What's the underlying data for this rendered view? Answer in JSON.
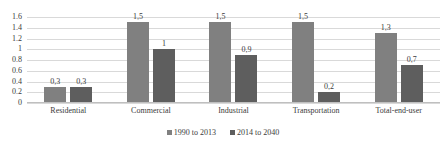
{
  "chart_data": {
    "type": "bar",
    "title": "",
    "subtitle": "",
    "xlabel": "",
    "ylabel": "",
    "ylim": [
      0,
      1.6
    ],
    "grid": true,
    "legend_position": "bottom",
    "categories": [
      "Residential",
      "Commercial",
      "Industrial",
      "Transportation",
      "Total-end-user"
    ],
    "y_ticks": [
      "0",
      "0.2",
      "0.4",
      "0.6",
      "0.8",
      "1",
      "1.2",
      "1.4",
      "1.6"
    ],
    "y_tick_values": [
      0,
      0.2,
      0.4,
      0.6,
      0.8,
      1,
      1.2,
      1.4,
      1.6
    ],
    "series": [
      {
        "name": "1990 to 2013",
        "color": "#808080",
        "values": [
          0.3,
          1.5,
          1.5,
          1.5,
          1.3
        ],
        "labels": [
          "0,3",
          "1,5",
          "1,5",
          "1,5",
          "1,3"
        ]
      },
      {
        "name": "2014 to 2040",
        "color": "#5e5e5e",
        "values": [
          0.3,
          1.0,
          0.9,
          0.2,
          0.7
        ],
        "labels": [
          "0,3",
          "1",
          "0,9",
          "0,2",
          "0,7"
        ]
      }
    ]
  }
}
